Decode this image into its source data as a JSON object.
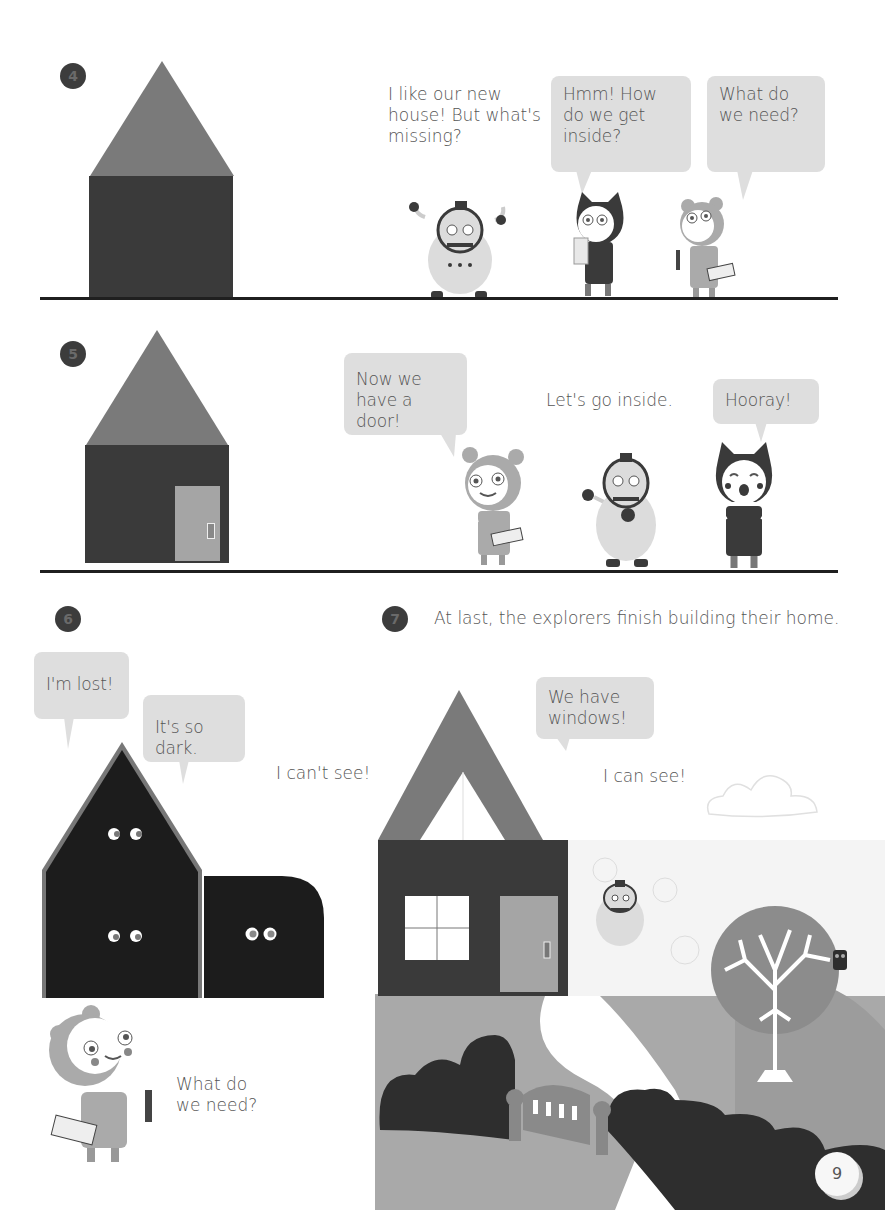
{
  "page": {
    "page_number": "9",
    "background": "#ffffff"
  },
  "colors": {
    "roof": "#7a7a7a",
    "wall": "#3a3a3a",
    "dark_wall": "#1c1c1c",
    "door": "#a5a5a5",
    "bubble": "#dedede",
    "ground_line": "#1f1f1f",
    "grass": "#a9a9a9",
    "bush": "#2e2e2e",
    "path": "#ffffff"
  },
  "panel4": {
    "number": "4",
    "speech": [
      {
        "speaker": "robot",
        "text_lines": [
          "I like our new",
          "house! But what's",
          "missing?"
        ],
        "has_bubble": false
      },
      {
        "speaker": "cat",
        "text_lines": [
          "Hmm! How",
          "do we get",
          "inside?"
        ],
        "has_bubble": true
      },
      {
        "speaker": "bear",
        "text_lines": [
          "What do",
          "we need?"
        ],
        "has_bubble": true
      }
    ]
  },
  "panel5": {
    "number": "5",
    "speech": [
      {
        "speaker": "bear",
        "text_lines": [
          "Now we",
          "have a door!"
        ],
        "has_bubble": true
      },
      {
        "speaker": "robot",
        "text_lines": [
          "Let's go inside."
        ],
        "has_bubble": false
      },
      {
        "speaker": "cat",
        "text_lines": [
          "Hooray!"
        ],
        "has_bubble": true
      }
    ]
  },
  "panel6": {
    "number": "6",
    "speech": [
      {
        "text_lines": [
          "I'm lost!"
        ],
        "has_bubble": true
      },
      {
        "text_lines": [
          "It's so dark."
        ],
        "has_bubble": true
      },
      {
        "text_lines": [
          "I can't see!"
        ],
        "has_bubble": false
      },
      {
        "speaker": "bear",
        "text_lines": [
          "What do",
          "we need?"
        ],
        "has_bubble": false
      }
    ]
  },
  "panel7": {
    "number": "7",
    "caption": "At last, the explorers finish building their home.",
    "speech": [
      {
        "text_lines": [
          "We have",
          "windows!"
        ],
        "has_bubble": true
      },
      {
        "text_lines": [
          "I can see!"
        ],
        "has_bubble": false
      }
    ]
  },
  "icons": {
    "house": "house-icon",
    "cat_character": "cat-character-icon",
    "bear_character": "bear-character-icon",
    "robot_character": "robot-character-icon",
    "tree": "tree-icon",
    "owl": "owl-icon",
    "cloud": "cloud-icon",
    "gate": "gate-icon"
  }
}
